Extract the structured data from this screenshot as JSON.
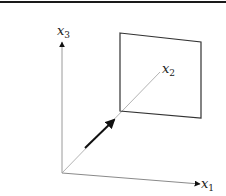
{
  "diagram": {
    "type": "3d-coordinate-axes-with-plane",
    "axes": [
      {
        "id": "x1",
        "base": "x",
        "sub": "1",
        "direction": "right"
      },
      {
        "id": "x2",
        "base": "x",
        "sub": "2",
        "direction": "depth"
      },
      {
        "id": "x3",
        "base": "x",
        "sub": "3",
        "direction": "up"
      }
    ],
    "elements": {
      "plane": {
        "description": "rectangle plane intersected by x2 axis"
      },
      "vector": {
        "description": "bold arrow along x2 axis from origin toward plane"
      }
    },
    "colors": {
      "axis": "#9a9a9a",
      "plane": "#333333",
      "vector": "#111111",
      "border": "#1a1a1a"
    }
  }
}
